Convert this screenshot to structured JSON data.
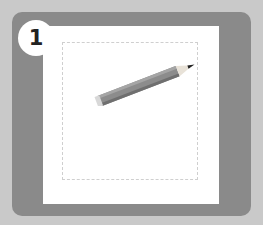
{
  "step": {
    "number": "1"
  },
  "colors": {
    "background": "#c9c9c9",
    "card": "#8a8a8a",
    "paper": "#ffffff",
    "pencil_body": "#8c8c8c",
    "pencil_tip": "#222222"
  },
  "icons": {
    "pencil": "pencil-icon"
  }
}
